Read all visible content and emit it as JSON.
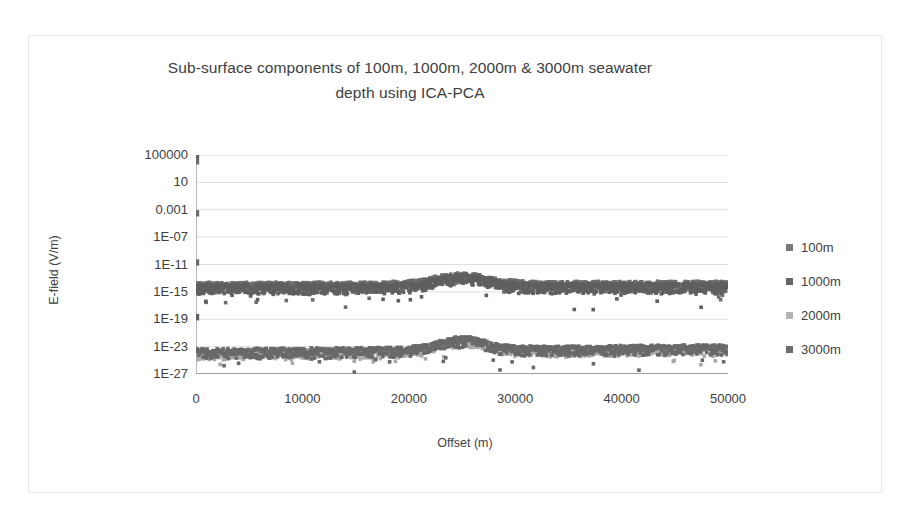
{
  "chart_data": {
    "type": "scatter",
    "title": "Sub-surface components of 100m, 1000m, 2000m & 3000m seawater depth using ICA-PCA",
    "title_line1": "Sub-surface components of 100m, 1000m, 2000m & 3000m seawater",
    "title_line2": "depth using ICA-PCA",
    "xlabel": "Offset (m)",
    "ylabel": "E-field (V/m)",
    "xlim": [
      0,
      50000
    ],
    "xticks": [
      0,
      10000,
      20000,
      30000,
      40000,
      50000
    ],
    "xtick_labels": [
      "0",
      "10000",
      "20000",
      "30000",
      "40000",
      "50000"
    ],
    "yscale": "log",
    "ylim": [
      1e-27,
      100000.0
    ],
    "yticks": [
      100000.0,
      10,
      0.001,
      1e-07,
      1e-11,
      1e-15,
      1e-19,
      1e-23,
      1e-27
    ],
    "ytick_labels": [
      "100000",
      "10",
      "0.001",
      "1E-07",
      "1E-11",
      "1E-15",
      "1E-19",
      "1E-23",
      "1E-27"
    ],
    "grid": true,
    "grid_color": "#dedede",
    "legend_position": "right",
    "plot_bgcolor": "#ffffff",
    "series": [
      {
        "name": "100m",
        "color": "#6e6e6e",
        "marker": "square",
        "band": {
          "x_start": 0,
          "x_end": 50000,
          "center_log10_start": -13.6,
          "center_log10_end": -13.4,
          "peak_x": 25000,
          "peak_log10_gain": 1.3,
          "peak_width": 3600,
          "thickness_log10": 1.5,
          "spread_log10": 0.9,
          "n_points": 1150
        },
        "origin_spikes": [
          {
            "x": 0,
            "y": 400000.0
          },
          {
            "x": 0,
            "y": 12000.0
          },
          {
            "x": 0,
            "y": 0.0003
          },
          {
            "x": 0,
            "y": 2e-11
          }
        ]
      },
      {
        "name": "1000m",
        "color": "#5f5f5f",
        "marker": "square",
        "band": {
          "x_start": 0,
          "x_end": 50000,
          "center_log10_start": -13.9,
          "center_log10_end": -13.7,
          "peak_x": 25000,
          "peak_log10_gain": 1.4,
          "peak_width": 3400,
          "thickness_log10": 1.4,
          "spread_log10": 0.95,
          "n_points": 1150
        },
        "origin_spikes": [
          {
            "x": 0,
            "y": 100000.0
          },
          {
            "x": 0,
            "y": 2e-19
          }
        ]
      },
      {
        "name": "2000m",
        "color": "#a8a8a8",
        "marker": "square",
        "band": {
          "x_start": 0,
          "x_end": 50000,
          "center_log10_start": -23.6,
          "center_log10_end": -22.9,
          "peak_x": 25000,
          "peak_log10_gain": 1.6,
          "peak_width": 3200,
          "thickness_log10": 1.3,
          "spread_log10": 1.0,
          "n_points": 1100
        },
        "origin_spikes": []
      },
      {
        "name": "3000m",
        "color": "#696969",
        "marker": "square",
        "band": {
          "x_start": 0,
          "x_end": 50000,
          "center_log10_start": -23.3,
          "center_log10_end": -22.7,
          "peak_x": 25000,
          "peak_log10_gain": 1.5,
          "peak_width": 3000,
          "thickness_log10": 1.4,
          "spread_log10": 1.0,
          "n_points": 1100
        },
        "origin_spikes": []
      }
    ]
  },
  "legend": {
    "items": [
      {
        "label": "100m",
        "color": "#7a7a7a"
      },
      {
        "label": "1000m",
        "color": "#666666"
      },
      {
        "label": "2000m",
        "color": "#b4b4b4"
      },
      {
        "label": "3000m",
        "color": "#6d6d6d"
      }
    ]
  }
}
